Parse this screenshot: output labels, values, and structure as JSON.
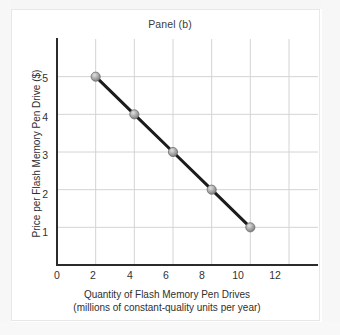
{
  "figure": {
    "title": "Panel (b)",
    "background_color": "#ffffff",
    "border_color": "#e8e8e8"
  },
  "axes": {
    "y_title": "Price per Flash Memory Pen Drive ($)",
    "x_title_line1": "Quantity of Flash Memory Pen Drives",
    "x_title_line2": "(millions of constant-quality units per year)"
  },
  "chart_data": {
    "type": "line",
    "title": "Panel (b)",
    "xlabel": "Quantity of Flash Memory Pen Drives (millions of constant-quality units per year)",
    "ylabel": "Price per Flash Memory Pen Drive ($)",
    "x": [
      2,
      4,
      6,
      8,
      10
    ],
    "values": [
      5,
      4,
      3,
      2,
      1
    ],
    "series": [
      {
        "name": "Demand",
        "x": [
          2,
          4,
          6,
          8,
          10
        ],
        "values": [
          5,
          4,
          3,
          2,
          1
        ]
      }
    ],
    "xlim": [
      0,
      13.5
    ],
    "ylim": [
      0,
      6
    ],
    "xticks": [
      0,
      2,
      4,
      6,
      8,
      10,
      12
    ],
    "xtick_labels": [
      "0",
      "2",
      "4",
      "6",
      "8",
      "10",
      "12"
    ],
    "yticks": [
      1,
      2,
      3,
      4,
      5
    ],
    "ytick_labels": [
      "1",
      "2",
      "3",
      "4",
      "5"
    ],
    "grid": true,
    "grid_color": "#d4d4d4",
    "legend": false,
    "line_color": "#1c1c1c",
    "marker_color": "#9b9b9b",
    "marker_shape": "circle",
    "axis_color": "#2b2b2b"
  },
  "x_tick_labels": [
    {
      "label": "0",
      "px": 57
    },
    {
      "label": "2",
      "px": 93
    },
    {
      "label": "4",
      "px": 130
    },
    {
      "label": "6",
      "px": 166
    },
    {
      "label": "8",
      "px": 202
    },
    {
      "label": "10",
      "px": 238
    },
    {
      "label": "12",
      "px": 275
    }
  ],
  "y_tick_labels": [
    {
      "label": "5",
      "py": 79
    },
    {
      "label": "4",
      "py": 118
    },
    {
      "label": "3",
      "py": 156
    },
    {
      "label": "2",
      "py": 195
    },
    {
      "label": "1",
      "py": 233
    }
  ]
}
